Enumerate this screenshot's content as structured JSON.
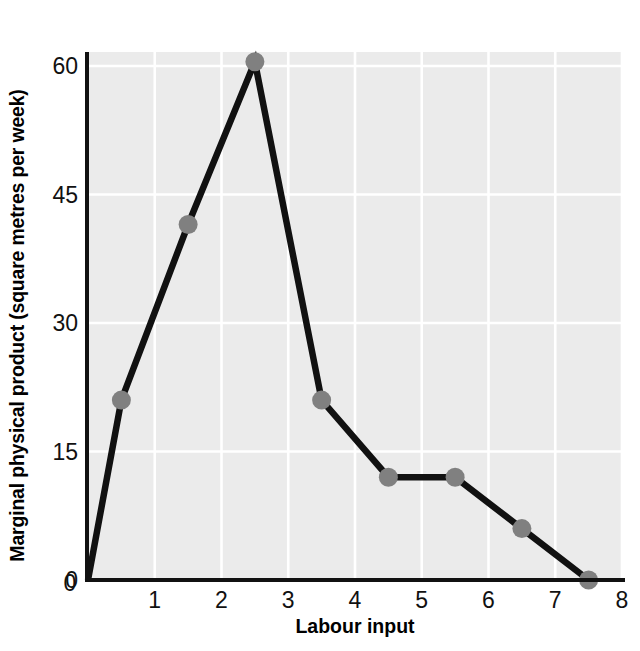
{
  "chart_data": {
    "type": "line",
    "title": "",
    "xlabel": "Labour input",
    "ylabel": "Marginal physical product (square metres per week)",
    "xlim": [
      0,
      8
    ],
    "ylim": [
      0,
      64
    ],
    "xticks": [
      "0",
      "1",
      "2",
      "3",
      "4",
      "5",
      "6",
      "7",
      "8"
    ],
    "xtick_values": [
      0,
      1,
      2,
      3,
      4,
      5,
      6,
      7,
      8
    ],
    "yticks": [
      "0",
      "15",
      "30",
      "45",
      "60"
    ],
    "ytick_values": [
      0,
      15,
      30,
      45,
      60
    ],
    "grid": true,
    "grid_color": "#ffffff",
    "plot_background": "#ebebeb",
    "line_color": "#111111",
    "marker_color": "#808080",
    "legend": "none",
    "series": [
      {
        "name": "Marginal physical product",
        "x": [
          0,
          0.5,
          1.5,
          2.5,
          3.5,
          4.5,
          5.5,
          6.5,
          7.5
        ],
        "y": [
          0,
          21,
          41.5,
          60.5,
          21,
          12,
          12,
          6,
          0
        ],
        "markers_shown_at_x": [
          0.5,
          1.5,
          2.5,
          3.5,
          4.5,
          5.5,
          6.5,
          7.5
        ]
      }
    ]
  },
  "axis_titles": {
    "y": "Marginal physical product (square metres per week)",
    "x": "Labour input"
  }
}
